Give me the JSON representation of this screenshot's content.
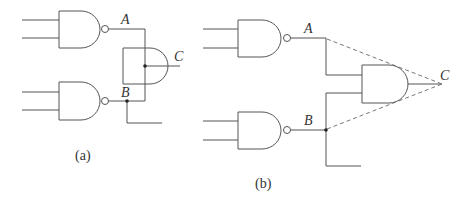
{
  "figure_a": {
    "caption": "(a)",
    "labels": {
      "a": "A",
      "b": "B",
      "c": "C"
    },
    "gates": [
      {
        "type": "NAND",
        "name": "nand-top"
      },
      {
        "type": "NAND",
        "name": "nand-bottom"
      },
      {
        "type": "AND",
        "name": "and-output"
      }
    ]
  },
  "figure_b": {
    "caption": "(b)",
    "labels": {
      "a": "A",
      "b": "B",
      "c": "C"
    },
    "gates": [
      {
        "type": "NAND",
        "name": "nand-top"
      },
      {
        "type": "NAND",
        "name": "nand-bottom"
      },
      {
        "type": "AND",
        "name": "and-output"
      }
    ],
    "annotations": "dashed lines from A and B converge at C"
  },
  "colors": {
    "line": "#555555",
    "dash": "#777777",
    "background": "#ffffff"
  }
}
